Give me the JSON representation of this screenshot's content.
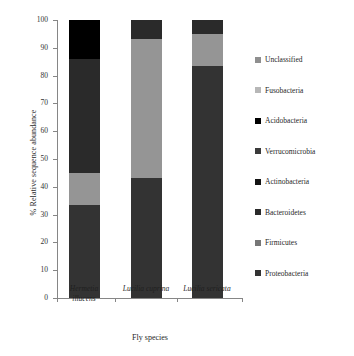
{
  "chart_data": {
    "type": "bar",
    "subtype": "stacked-bar",
    "title": "",
    "xlabel": "Fly species",
    "ylabel": "% Relative sequence abundance",
    "ylim": [
      0,
      100
    ],
    "yticks": [
      0,
      10,
      20,
      30,
      40,
      50,
      60,
      70,
      80,
      90,
      100
    ],
    "ytick_labels": [
      "0",
      "10",
      "20",
      "30",
      "40",
      "50",
      "60",
      "70",
      "80",
      "90",
      "100"
    ],
    "grid": false,
    "legend_position": "right",
    "categories": [
      "Hermetia illucens",
      "Lucilia cuprina",
      "Lucilia sericata"
    ],
    "category_lines": [
      [
        "Hermetia",
        "illucens"
      ],
      [
        "Lucilia cuprina"
      ],
      [
        "Lucilia sericata"
      ]
    ],
    "series": [
      {
        "name": "Proteobacteria",
        "color": "#333333",
        "values": [
          33.5,
          43.0,
          83.5
        ]
      },
      {
        "name": "Firmicutes",
        "color": "#959595",
        "values": [
          11.5,
          50.0,
          11.5
        ]
      },
      {
        "name": "Bacteroidetes",
        "color": "#2a2a2a",
        "values": [
          41.0,
          7.0,
          5.0
        ]
      },
      {
        "name": "Actinobacteria",
        "color": "#141414",
        "values": [
          0,
          0,
          0
        ]
      },
      {
        "name": "Verrucomicrobia",
        "color": "#3a3a3a",
        "values": [
          0,
          0,
          0
        ]
      },
      {
        "name": "Acidobacteria",
        "color": "#000000",
        "values": [
          14.0,
          0,
          0
        ]
      },
      {
        "name": "Fusobacteria",
        "color": "#b7b7b7",
        "values": [
          0,
          0,
          0
        ]
      },
      {
        "name": "Unclassified",
        "color": "#8f8f8f",
        "values": [
          0,
          0,
          0
        ]
      }
    ],
    "legend_entries": [
      {
        "label": "Unclassified",
        "color": "#8f8f8f"
      },
      {
        "label": "Fusobacteria",
        "color": "#b7b7b7"
      },
      {
        "label": "Acidobacteria",
        "color": "#000000"
      },
      {
        "label": "Verrucomicrobia",
        "color": "#3a3a3a"
      },
      {
        "label": "Actinobacteria",
        "color": "#141414"
      },
      {
        "label": "Bacteroidetes",
        "color": "#2a2a2a"
      },
      {
        "label": "Firmicutes",
        "color": "#777777"
      },
      {
        "label": "Proteobacteria",
        "color": "#333333"
      }
    ],
    "stacks": [
      {
        "category": "Hermetia illucens",
        "segments": [
          {
            "name": "Proteobacteria",
            "start": 0,
            "end": 33.5,
            "value": 33.5,
            "color": "#333333"
          },
          {
            "name": "Firmicutes",
            "start": 33.5,
            "end": 45.0,
            "value": 11.5,
            "color": "#959595"
          },
          {
            "name": "Bacteroidetes",
            "start": 45.0,
            "end": 86.0,
            "value": 41.0,
            "color": "#2a2a2a"
          },
          {
            "name": "Acidobacteria",
            "start": 86.0,
            "end": 100.0,
            "value": 14.0,
            "color": "#000000"
          }
        ]
      },
      {
        "category": "Lucilia cuprina",
        "segments": [
          {
            "name": "Proteobacteria",
            "start": 0,
            "end": 43.0,
            "value": 43.0,
            "color": "#333333"
          },
          {
            "name": "Firmicutes",
            "start": 43.0,
            "end": 93.0,
            "value": 50.0,
            "color": "#959595"
          },
          {
            "name": "Bacteroidetes",
            "start": 93.0,
            "end": 100.0,
            "value": 7.0,
            "color": "#2a2a2a"
          }
        ]
      },
      {
        "category": "Lucilia sericata",
        "segments": [
          {
            "name": "Proteobacteria",
            "start": 0,
            "end": 83.5,
            "value": 83.5,
            "color": "#333333"
          },
          {
            "name": "Firmicutes",
            "start": 83.5,
            "end": 95.0,
            "value": 11.5,
            "color": "#959595"
          },
          {
            "name": "Bacteroidetes",
            "start": 95.0,
            "end": 100.0,
            "value": 5.0,
            "color": "#2a2a2a"
          }
        ]
      }
    ]
  },
  "axes": {
    "y_title": "% Relative sequence abundance",
    "x_title": "Fly species"
  }
}
